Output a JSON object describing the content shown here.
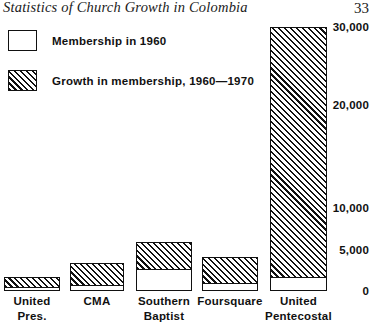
{
  "document": {
    "title": "Statistics of Church Growth in Colombia",
    "page_number": "33"
  },
  "legend": {
    "items": [
      {
        "label": "Membership in 1960",
        "style": "solid-white"
      },
      {
        "label": "Growth in membership, 1960—1970",
        "style": "hatched"
      }
    ]
  },
  "chart_data": {
    "type": "bar",
    "subtype": "stacked",
    "title": "Statistics of Church Growth in Colombia",
    "xlabel": "",
    "ylabel": "",
    "grid": false,
    "legend_position": "top-left",
    "axis_note": "Vertical axis is non-linear: 0, 5,000 and 10,000 are spaced more widely than 10,000 to 20,000 and 20,000 to 30,000.",
    "ylim": [
      0,
      30000
    ],
    "ytick_labels": [
      "0",
      "5,000",
      "10,000",
      "20,000",
      "30,000"
    ],
    "ytick_values": [
      0,
      5000,
      10000,
      20000,
      30000
    ],
    "categories": [
      "United Pres.",
      "CMA",
      "Southern Baptist",
      "Foursquare",
      "United Pentecostal"
    ],
    "category_lines": [
      [
        "United",
        "Pres."
      ],
      [
        "CMA",
        ""
      ],
      [
        "Southern",
        "Baptist"
      ],
      [
        "Foursquare",
        ""
      ],
      [
        "United",
        "Pentecostal"
      ]
    ],
    "series": [
      {
        "name": "Membership in 1960",
        "values": [
          500,
          700,
          2700,
          1000,
          1700
        ]
      },
      {
        "name": "Growth in membership, 1960—1970",
        "values": [
          1200,
          2700,
          3300,
          3200,
          28300
        ]
      }
    ],
    "totals": [
      1700,
      3400,
      6000,
      4200,
      30000
    ]
  },
  "colors": {
    "ink": "#111111",
    "background": "#ffffff"
  }
}
